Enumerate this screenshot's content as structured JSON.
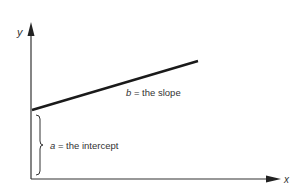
{
  "diagram": {
    "axes": {
      "y_label": "y",
      "x_label": "x"
    },
    "line": {
      "slope_var": "b",
      "slope_text": " = the slope"
    },
    "intercept": {
      "var": "a",
      "text": " = the intercept"
    },
    "colors": {
      "axis": "#333333",
      "line": "#1a1a1a",
      "text": "#333333"
    }
  }
}
